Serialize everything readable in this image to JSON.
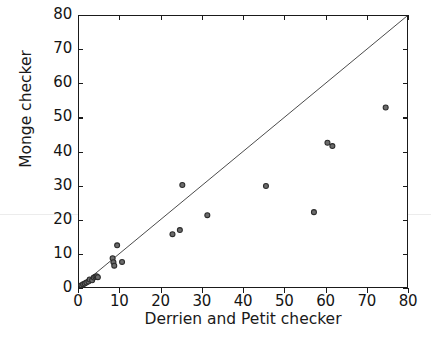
{
  "chart_data": {
    "type": "scatter",
    "title": "",
    "xlabel": "Derrien and Petit checker",
    "ylabel": "Monge checker",
    "xlim": [
      0,
      80
    ],
    "ylim": [
      0,
      80
    ],
    "xticks": [
      0,
      10,
      20,
      30,
      40,
      50,
      60,
      70,
      80
    ],
    "yticks": [
      0,
      10,
      20,
      30,
      40,
      50,
      60,
      70,
      80
    ],
    "grid": false,
    "legend": null,
    "marker": {
      "shape": "circle",
      "facecolor": "#6b6b6b",
      "edgecolor": "#2b2b2b",
      "size": 5
    },
    "reference_line": {
      "name": "identity-line",
      "kind": "y = x",
      "from": [
        0,
        0
      ],
      "to": [
        80,
        80
      ],
      "color": "#4a4a4a"
    },
    "points": [
      {
        "x": 0.6,
        "y": 0.5
      },
      {
        "x": 1.0,
        "y": 0.8
      },
      {
        "x": 1.4,
        "y": 1.0
      },
      {
        "x": 1.8,
        "y": 1.3
      },
      {
        "x": 2.3,
        "y": 1.6
      },
      {
        "x": 2.6,
        "y": 2.2
      },
      {
        "x": 3.2,
        "y": 2.0
      },
      {
        "x": 3.6,
        "y": 2.8
      },
      {
        "x": 4.0,
        "y": 3.0
      },
      {
        "x": 4.3,
        "y": 3.2
      },
      {
        "x": 4.6,
        "y": 2.9
      },
      {
        "x": 8.2,
        "y": 8.5
      },
      {
        "x": 8.4,
        "y": 7.3
      },
      {
        "x": 8.6,
        "y": 6.3
      },
      {
        "x": 9.3,
        "y": 12.3
      },
      {
        "x": 10.5,
        "y": 7.4
      },
      {
        "x": 22.8,
        "y": 15.6
      },
      {
        "x": 24.6,
        "y": 16.8
      },
      {
        "x": 25.2,
        "y": 30.1
      },
      {
        "x": 31.3,
        "y": 21.2
      },
      {
        "x": 45.6,
        "y": 29.8
      },
      {
        "x": 57.3,
        "y": 22.1
      },
      {
        "x": 60.6,
        "y": 42.6
      },
      {
        "x": 61.8,
        "y": 41.6
      },
      {
        "x": 74.8,
        "y": 53.0
      }
    ]
  }
}
